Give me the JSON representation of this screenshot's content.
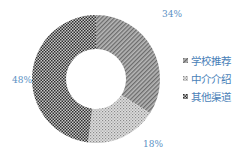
{
  "chart_data": {
    "type": "pie",
    "subtype": "donut",
    "title": "",
    "categories": [
      "学校推荐",
      "中介介绍",
      "其他渠道"
    ],
    "values": [
      34,
      18,
      48
    ],
    "unit": "%",
    "data_labels": [
      "34%",
      "18%",
      "48%"
    ],
    "legend_position": "right",
    "start_angle": "12 o'clock",
    "direction": "clockwise"
  },
  "labels": {
    "school": "34%",
    "agency": "18%",
    "other": "48%"
  },
  "legend": {
    "items": [
      {
        "label": "学校推荐",
        "pattern": "diagonal"
      },
      {
        "label": "中介介绍",
        "pattern": "dots"
      },
      {
        "label": "其他渠道",
        "pattern": "checker"
      }
    ]
  },
  "colors": {
    "label_text": "#5a8fc4",
    "legend_text": "#4a7fb8"
  }
}
